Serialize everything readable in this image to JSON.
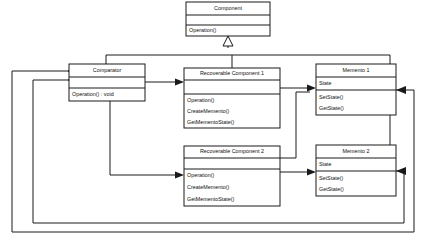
{
  "diagram": {
    "kind": "uml-class-diagram",
    "background_color": "#ffffff",
    "line_color": "#1a1a1a",
    "box_fill": "#ffffff"
  },
  "classes": [
    {
      "id": "component",
      "name": "Component",
      "attributes": [],
      "operations": [
        "Operation()"
      ],
      "x": 186,
      "y": 2,
      "width": 84,
      "title_h": 13,
      "attr_h": 10,
      "op_h": 11
    },
    {
      "id": "comparator",
      "name": "Comparator",
      "attributes": [],
      "operations": [
        "Operation() : void"
      ],
      "x": 69,
      "y": 64,
      "width": 76,
      "title_h": 13,
      "attr_h": 11,
      "op_h": 13
    },
    {
      "id": "recoverable-component-1",
      "name": "Recoverable Component 1",
      "attributes": [],
      "operations": [
        "Operation()",
        "CreateMemento()",
        "GetMementoState()"
      ],
      "x": 184,
      "y": 68,
      "width": 96,
      "title_h": 12,
      "attr_h": 14,
      "op_h": 34
    },
    {
      "id": "memento-1",
      "name": "Memento 1",
      "attributes": [
        "State"
      ],
      "operations": [
        "SetState()",
        "GetState()"
      ],
      "x": 316,
      "y": 64,
      "width": 80,
      "title_h": 13,
      "attr_h": 13,
      "op_h": 25
    },
    {
      "id": "recoverable-component-2",
      "name": "Recoverable Component 2",
      "attributes": [],
      "operations": [
        "Operation()",
        "CreateMemento()",
        "GetMementoState()"
      ],
      "x": 184,
      "y": 146,
      "width": 96,
      "title_h": 12,
      "attr_h": 14,
      "op_h": 34
    },
    {
      "id": "memento-2",
      "name": "Memento 2",
      "attributes": [
        "State"
      ],
      "operations": [
        "SetState()",
        "GetState()"
      ],
      "x": 316,
      "y": 145,
      "width": 80,
      "title_h": 13,
      "attr_h": 13,
      "op_h": 25
    }
  ],
  "relationships": [
    {
      "id": "gen-rc1-component",
      "type": "generalization",
      "from": "recoverable-component-1",
      "to": "component"
    },
    {
      "id": "gen-rc2-component",
      "type": "generalization",
      "from": "recoverable-component-2",
      "to": "component"
    },
    {
      "id": "assoc-comparator-rc1",
      "type": "association",
      "from": "comparator",
      "to": "recoverable-component-1"
    },
    {
      "id": "assoc-comparator-rc2",
      "type": "association",
      "from": "comparator",
      "to": "recoverable-component-2"
    },
    {
      "id": "assoc-rc1-memento1",
      "type": "association",
      "from": "recoverable-component-1",
      "to": "memento-1"
    },
    {
      "id": "assoc-rc2-memento2",
      "type": "association",
      "from": "recoverable-component-2",
      "to": "memento-2"
    },
    {
      "id": "assoc-rc2-memento1",
      "type": "association",
      "from": "recoverable-component-2",
      "to": "memento-1"
    },
    {
      "id": "agg-memento1-comparator",
      "type": "aggregation",
      "from": "memento-1",
      "to": "comparator"
    },
    {
      "id": "agg-memento2-comparator",
      "type": "aggregation",
      "from": "memento-2",
      "to": "comparator"
    }
  ]
}
